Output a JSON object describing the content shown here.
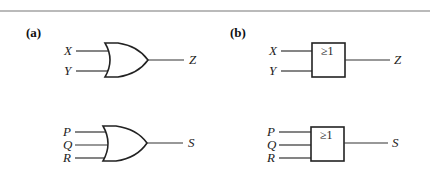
{
  "figure": {
    "panels": [
      {
        "id": "a",
        "label": "(a)",
        "style": "distinctive-shape OR gate",
        "gates": [
          {
            "type": "OR",
            "inputs": [
              "X",
              "Y"
            ],
            "output": "Z"
          },
          {
            "type": "OR",
            "inputs": [
              "P",
              "Q",
              "R"
            ],
            "output": "S"
          }
        ]
      },
      {
        "id": "b",
        "label": "(b)",
        "style": "IEC rectangular OR gate",
        "gates": [
          {
            "type": "OR",
            "symbol": "≥1",
            "inputs": [
              "X",
              "Y"
            ],
            "output": "Z"
          },
          {
            "type": "OR",
            "symbol": "≥1",
            "inputs": [
              "P",
              "Q",
              "R"
            ],
            "output": "S"
          }
        ]
      }
    ],
    "colors": {
      "line": "#222222",
      "rule": "#777777",
      "background": "#ffffff"
    }
  }
}
